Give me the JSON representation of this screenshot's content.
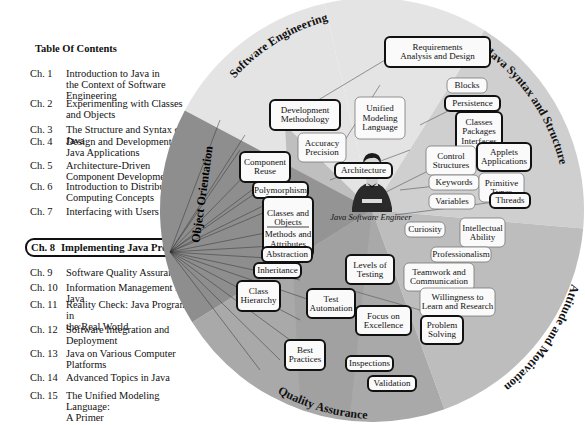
{
  "toc": {
    "title": "Table Of Contents",
    "items": [
      {
        "num": "Ch. 1",
        "text": "Introduction to Java in the Context of Software Engineering",
        "lines": [
          "Introduction to Java in",
          "the Context of Software",
          "Engineering"
        ]
      },
      {
        "num": "Ch. 2",
        "text": "Experimenting with Classes and Objects",
        "lines": [
          "Experimenting with Classes",
          "and Objects"
        ]
      },
      {
        "num": "Ch. 3",
        "text": "The Structure and Syntax of Java",
        "lines": [
          "The Structure and Syntax of Java"
        ]
      },
      {
        "num": "Ch. 4",
        "text": "Design and Development of Java Applications",
        "lines": [
          "Design and Development of",
          "Java Applications"
        ]
      },
      {
        "num": "Ch. 5",
        "text": "Architecture-Driven Component Development",
        "lines": [
          "Architecture-Driven",
          "Component Development"
        ]
      },
      {
        "num": "Ch. 6",
        "text": "Introduction to Distributed Computing Concepts",
        "lines": [
          "Introduction to Distributed",
          "Computing Concepts"
        ]
      },
      {
        "num": "Ch. 7",
        "text": "Interfacing with Users",
        "lines": [
          "Interfacing with Users"
        ]
      },
      {
        "num": "Ch. 8",
        "text": "Implementing Java Programs",
        "lines": [
          "Implementing Java Programs"
        ],
        "selected": true
      },
      {
        "num": "Ch. 9",
        "text": "Software Quality Assurance",
        "lines": [
          "Software Quality Assurance"
        ]
      },
      {
        "num": "Ch. 10",
        "text": "Information Management in Java",
        "lines": [
          "Information Management in Java"
        ]
      },
      {
        "num": "Ch. 11",
        "text": "Reality Check: Java Programs in the Real World",
        "lines": [
          "Reality Check: Java Programs in",
          "the Real World"
        ]
      },
      {
        "num": "Ch. 12",
        "text": "Software Integration and Deployment",
        "lines": [
          "Software Integration and",
          "Deployment"
        ]
      },
      {
        "num": "Ch. 13",
        "text": "Java on Various Computer Platforms",
        "lines": [
          "Java on Various Computer",
          "Platforms"
        ]
      },
      {
        "num": "Ch. 14",
        "text": "Advanced Topics in Java",
        "lines": [
          "Advanced Topics in Java"
        ]
      },
      {
        "num": "Ch. 15",
        "text": "The Unified Modeling Language: A Primer",
        "lines": [
          "The Unified Modeling Language:",
          "A Primer"
        ]
      }
    ]
  },
  "diagram": {
    "center_caption": "Java Software Engineer",
    "colors": {
      "software_engineering": "#e4e4e4",
      "java_syntax": "#cfcfcf",
      "attitude": "#bdbdbd",
      "quality": "#a9a9a9",
      "object_orientation": "#8e8e8e"
    },
    "sectors": [
      {
        "name": "Software Engineering",
        "nodes": [
          {
            "label": "Requirements Analysis and Design",
            "lines": [
              "Requirements",
              "Analysis and Design"
            ],
            "bold": true
          },
          {
            "label": "Development Methodology",
            "lines": [
              "Development",
              "Methodology"
            ],
            "bold": true
          },
          {
            "label": "Unified Modeling Language",
            "lines": [
              "Unified",
              "Modeling",
              "Language"
            ],
            "bold": false
          },
          {
            "label": "Accuracy Precision",
            "lines": [
              "Accuracy",
              "Precision"
            ],
            "bold": false
          },
          {
            "label": "Architecture",
            "lines": [
              "Architecture"
            ],
            "bold": true
          }
        ]
      },
      {
        "name": "Java Syntax and Structure",
        "nodes": [
          {
            "label": "Blocks",
            "lines": [
              "Blocks"
            ],
            "bold": false
          },
          {
            "label": "Persistence",
            "lines": [
              "Persistence"
            ],
            "bold": true
          },
          {
            "label": "Classes Packages Interfaces",
            "lines": [
              "Classes",
              "Packages",
              "Interfaces"
            ],
            "bold": true
          },
          {
            "label": "Control Structures",
            "lines": [
              "Control",
              "Structures"
            ],
            "bold": false
          },
          {
            "label": "Applets Applications",
            "lines": [
              "Applets",
              "Applications"
            ],
            "bold": true
          },
          {
            "label": "Keywords",
            "lines": [
              "Keywords"
            ],
            "bold": false
          },
          {
            "label": "Primitive Types",
            "lines": [
              "Primitive",
              "Types"
            ],
            "bold": false
          },
          {
            "label": "Variables",
            "lines": [
              "Variables"
            ],
            "bold": false
          },
          {
            "label": "Threads",
            "lines": [
              "Threads"
            ],
            "bold": true
          }
        ]
      },
      {
        "name": "Attitude and Motivation",
        "nodes": [
          {
            "label": "Curiosity",
            "lines": [
              "Curiosity"
            ],
            "bold": false
          },
          {
            "label": "Intellectual Ability",
            "lines": [
              "Intellectual",
              "Ability"
            ],
            "bold": false
          },
          {
            "label": "Professionalism",
            "lines": [
              "Professionalism"
            ],
            "bold": false
          },
          {
            "label": "Teamwork and Communication",
            "lines": [
              "Teamwork and",
              "Communication"
            ],
            "bold": false
          },
          {
            "label": "Willingness to Learn and Research",
            "lines": [
              "Willingness to",
              "Learn and Research"
            ],
            "bold": false
          },
          {
            "label": "Problem Solving",
            "lines": [
              "Problem",
              "Solving"
            ],
            "bold": true
          }
        ]
      },
      {
        "name": "Quality Assurance",
        "nodes": [
          {
            "label": "Levels of Testing",
            "lines": [
              "Levels of",
              "Testing"
            ],
            "bold": true
          },
          {
            "label": "Test Automation",
            "lines": [
              "Test",
              "Automation"
            ],
            "bold": true
          },
          {
            "label": "Focus on Excellence",
            "lines": [
              "Focus on",
              "Excellence"
            ],
            "bold": true
          },
          {
            "label": "Best Practices",
            "lines": [
              "Best",
              "Practices"
            ],
            "bold": true
          },
          {
            "label": "Inspections",
            "lines": [
              "Inspections"
            ],
            "bold": true
          },
          {
            "label": "Validation",
            "lines": [
              "Validation"
            ],
            "bold": true
          }
        ]
      },
      {
        "name": "Object Orientation",
        "nodes": [
          {
            "label": "Component Reuse",
            "lines": [
              "Component",
              "Reuse"
            ],
            "bold": true
          },
          {
            "label": "Polymorphism",
            "lines": [
              "Polymorphism"
            ],
            "bold": true
          },
          {
            "label": "Classes and Objects / Methods and Attributes",
            "lines": [
              "Classes and",
              "Objects",
              "Methods and",
              "Attributes"
            ],
            "bold": true
          },
          {
            "label": "Abstraction",
            "lines": [
              "Abstraction"
            ],
            "bold": true
          },
          {
            "label": "Inheritance",
            "lines": [
              "Inheritance"
            ],
            "bold": true
          },
          {
            "label": "Class Hierarchy",
            "lines": [
              "Class",
              "Hierarchy"
            ],
            "bold": true
          }
        ]
      }
    ]
  }
}
